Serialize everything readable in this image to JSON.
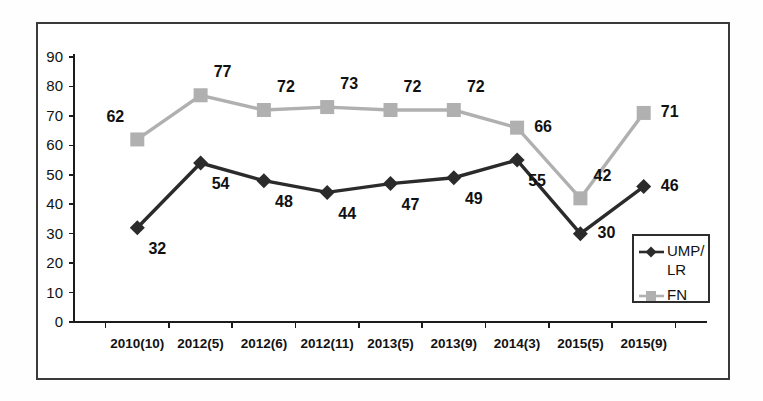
{
  "chart_data": {
    "type": "line",
    "title": "",
    "subtitle": "",
    "xlabel": "",
    "ylabel": "",
    "categories": [
      "2010(10)",
      "2012(5)",
      "2012(6)",
      "2012(11)",
      "2013(5)",
      "2013(9)",
      "2014(3)",
      "2015(5)",
      "2015(9)"
    ],
    "series": [
      {
        "name": "UMP/LR",
        "legend_label_lines": [
          "UMP/",
          "LR"
        ],
        "color": "#2b2b2b",
        "marker": "diamond",
        "values": [
          32,
          54,
          48,
          44,
          47,
          49,
          55,
          30,
          46
        ],
        "label_placement": [
          "below-right",
          "below-right",
          "below-right",
          "below-right",
          "below-right",
          "below-right",
          "below-right",
          "right",
          "right"
        ]
      },
      {
        "name": "FN",
        "legend_label_lines": [
          "FN"
        ],
        "color": "#b0b0b0",
        "marker": "square",
        "values": [
          62,
          77,
          72,
          73,
          72,
          72,
          66,
          42,
          71
        ],
        "label_placement": [
          "above-left",
          "above-right",
          "above-right",
          "above-right",
          "above-right",
          "above-right",
          "right",
          "above-right",
          "right"
        ]
      }
    ],
    "ylim": [
      0,
      90
    ],
    "ytick_step": 10,
    "yticks": [
      0,
      10,
      20,
      30,
      40,
      50,
      60,
      70,
      80,
      90
    ],
    "grid": false,
    "legend_position": "bottom-right",
    "axis_color": "#1c1c1c",
    "frame_color": "#3a3a3a",
    "background": "#ffffff"
  }
}
